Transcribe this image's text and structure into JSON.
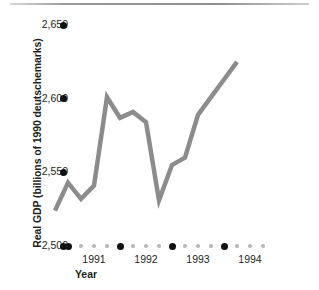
{
  "chart_data": {
    "type": "line",
    "title": "",
    "xlabel": "Year",
    "ylabel": "Real GDP (billions of 1990 deutschemarks)",
    "ylim": [
      2500,
      2650
    ],
    "yticks": [
      2500,
      2550,
      2600,
      2650
    ],
    "ytick_labels": [
      "2,500",
      "2,550",
      "2,600",
      "2,650"
    ],
    "xlim": [
      1990.75,
      1994.5
    ],
    "xticks": [
      1991.0,
      1992.0,
      1993.0,
      1994.0
    ],
    "xtick_labels": [
      "1991",
      "1992",
      "1993",
      "1994"
    ],
    "x_minor_step": 0.25,
    "grid": false,
    "legend": null,
    "line_color": "#8c8c8c",
    "line_width": 4.5,
    "series": [
      {
        "name": "Real GDP",
        "x": [
          1990.75,
          1991.0,
          1991.25,
          1991.5,
          1991.75,
          1992.0,
          1992.25,
          1992.5,
          1992.75,
          1993.0,
          1993.25,
          1993.5,
          1993.75,
          1994.0,
          1994.25
        ],
        "values": [
          2524,
          2543,
          2532,
          2541,
          2601,
          2587,
          2591,
          2584,
          2531,
          2555,
          2560,
          2589,
          2601,
          2613,
          2625
        ]
      }
    ],
    "annotations": []
  },
  "axes": {
    "y_title": "Real GDP (billions of 1990 deutschemarks)",
    "x_title": "Year"
  },
  "decoration": {
    "top_rule": "horizontal-rule"
  }
}
